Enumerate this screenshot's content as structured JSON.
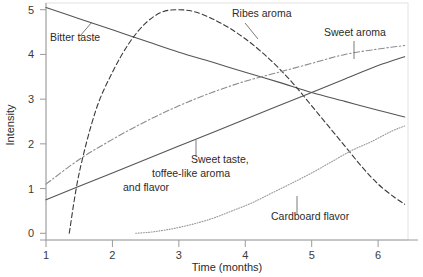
{
  "chart_data": {
    "type": "line",
    "title": "",
    "xlabel": "Time (months)",
    "ylabel": "Intensity",
    "xlim": [
      1,
      6.45
    ],
    "ylim": [
      -0.15,
      5.15
    ],
    "xticks": [
      "1",
      "2",
      "3",
      "4",
      "5",
      "6"
    ],
    "xtick_values": [
      1,
      2,
      3,
      4,
      5,
      6
    ],
    "yticks": [
      "0",
      "1",
      "2",
      "3",
      "4",
      "5"
    ],
    "ytick_values": [
      0,
      1,
      2,
      3,
      4,
      5
    ],
    "grid": false,
    "legend_position": "inline-annotations",
    "series": [
      {
        "name": "Bitter taste",
        "style": "solid",
        "color": "#555555",
        "x": [
          1.0,
          1.5,
          2.0,
          2.5,
          3.0,
          3.5,
          4.0,
          4.5,
          5.0,
          5.5,
          6.0,
          6.4
        ],
        "values": [
          5.05,
          4.8,
          4.55,
          4.3,
          4.05,
          3.83,
          3.6,
          3.38,
          3.15,
          2.95,
          2.75,
          2.6
        ]
      },
      {
        "name": "Ribes aroma",
        "style": "dashed",
        "color": "#3a3a3a",
        "x": [
          1.35,
          1.5,
          1.75,
          2.0,
          2.25,
          2.5,
          2.75,
          3.0,
          3.25,
          3.5,
          3.75,
          4.0,
          4.25,
          4.5,
          4.75,
          5.0,
          5.25,
          5.5,
          5.75,
          6.0,
          6.25,
          6.4
        ],
        "values": [
          0.0,
          1.35,
          2.75,
          3.6,
          4.25,
          4.7,
          4.95,
          5.0,
          4.95,
          4.8,
          4.6,
          4.35,
          4.05,
          3.7,
          3.3,
          2.85,
          2.4,
          1.95,
          1.5,
          1.1,
          0.8,
          0.65
        ]
      },
      {
        "name": "Sweet aroma",
        "style": "dashdot",
        "color": "#8c8c8c",
        "x": [
          1.0,
          1.5,
          2.0,
          2.5,
          3.0,
          3.5,
          4.0,
          4.5,
          5.0,
          5.5,
          6.0,
          6.4
        ],
        "values": [
          1.1,
          1.65,
          2.1,
          2.5,
          2.85,
          3.15,
          3.4,
          3.6,
          3.8,
          4.0,
          4.12,
          4.2
        ]
      },
      {
        "name": "Sweet taste, toffee-like aroma and flavor",
        "style": "solid",
        "color": "#555555",
        "x": [
          1.0,
          1.5,
          2.0,
          2.5,
          3.0,
          3.5,
          4.0,
          4.5,
          5.0,
          5.5,
          6.0,
          6.4
        ],
        "values": [
          0.75,
          1.05,
          1.35,
          1.65,
          1.95,
          2.25,
          2.55,
          2.85,
          3.15,
          3.45,
          3.75,
          3.95
        ]
      },
      {
        "name": "Cardboard flavor",
        "style": "dotted",
        "color": "#9a9a9a",
        "x": [
          2.35,
          2.6,
          2.9,
          3.2,
          3.5,
          3.8,
          4.1,
          4.4,
          4.7,
          5.0,
          5.3,
          5.6,
          5.9,
          6.2,
          6.4
        ],
        "values": [
          0.0,
          0.03,
          0.1,
          0.2,
          0.33,
          0.5,
          0.68,
          0.9,
          1.12,
          1.35,
          1.6,
          1.85,
          2.05,
          2.28,
          2.4
        ]
      }
    ],
    "annotations": [
      {
        "text": "Bitter taste",
        "x_px": 50,
        "y_px": 41
      },
      {
        "text": "Ribes aroma",
        "x_px": 232,
        "y_px": 17
      },
      {
        "text": "Sweet aroma",
        "x_px": 324,
        "y_px": 36
      },
      {
        "text": "Sweet taste,",
        "x_px": 191,
        "y_px": 163
      },
      {
        "text": "toffee-like aroma",
        "x_px": 152,
        "y_px": 177
      },
      {
        "text": "and flavor",
        "x_px": 123,
        "y_px": 191
      },
      {
        "text": "Cardboard flavor",
        "x_px": 271,
        "y_px": 220
      }
    ]
  },
  "colors": {
    "axis": "#9a9a9a",
    "frame": "#d8d8d8",
    "text": "#2b2b2b",
    "background": "#ffffff"
  }
}
